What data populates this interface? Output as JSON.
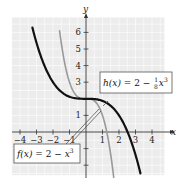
{
  "chart_data": {
    "type": "line",
    "title": "",
    "xlabel": "x",
    "ylabel": "y",
    "xlim": [
      -4.5,
      4.75
    ],
    "ylim": [
      -2.6,
      6.9
    ],
    "grid": true,
    "x_ticks": [
      -4,
      -3,
      -2,
      -1,
      1,
      2,
      3,
      4
    ],
    "x_tick_labels": [
      "−4",
      "−3",
      "−2",
      "−1",
      "1",
      "2",
      "3",
      "4"
    ],
    "y_ticks": [
      1,
      2,
      3,
      4,
      5,
      6,
      -1,
      -2
    ],
    "y_tick_labels": [
      "1",
      "",
      "3",
      "4",
      "5",
      "6",
      "",
      ""
    ],
    "series": [
      {
        "name": "f(x) = 2 − x³",
        "formula": "2 - x^3",
        "color": "#999999",
        "width": 1.6,
        "x": [
          -1.6,
          -1.4,
          -1.2,
          -1.0,
          -0.8,
          -0.6,
          -0.4,
          -0.2,
          0,
          0.2,
          0.4,
          0.6,
          0.8,
          1.0,
          1.2,
          1.4,
          1.6,
          1.68
        ],
        "values": [
          6.1,
          4.74,
          3.73,
          3.0,
          2.51,
          2.22,
          2.06,
          2.01,
          2.0,
          1.99,
          1.94,
          1.78,
          1.49,
          1.0,
          0.27,
          -0.74,
          -2.1,
          -2.74
        ]
      },
      {
        "name": "h(x) = 2 − (1/8)x³",
        "formula": "2 - x^3/8",
        "color": "#111111",
        "width": 2.2,
        "x": [
          -3.25,
          -3.0,
          -2.5,
          -2.0,
          -1.5,
          -1.0,
          -0.5,
          0,
          0.5,
          1.0,
          1.5,
          2.0,
          2.5,
          3.0,
          3.3
        ],
        "values": [
          6.29,
          5.38,
          3.95,
          3.0,
          2.42,
          2.13,
          2.02,
          2.0,
          1.98,
          1.88,
          1.58,
          1.0,
          0.05,
          -1.38,
          -2.49
        ]
      }
    ],
    "annotations": [
      {
        "text": "h(x) = 2 − ⅛x³",
        "points_to": [
          1.3,
          1.72
        ]
      },
      {
        "text": "f(x) = 2 − x³",
        "points_to": [
          0.85,
          1.4
        ]
      }
    ]
  },
  "labels": {
    "x_axis": "x",
    "y_axis": "y",
    "h_label": {
      "func": "h(x)",
      "eq": " = 2 − ",
      "num": "1",
      "den": "8",
      "var": "x",
      "exp": "3"
    },
    "f_label": {
      "func": "f(x)",
      "eq": " = 2 − ",
      "var": "x",
      "exp": "3"
    }
  },
  "colors": {
    "grid_bg": "#ececec",
    "grid_line": "#ffffff",
    "axis": "#333333",
    "f_curve": "#999999",
    "h_curve": "#111111"
  }
}
